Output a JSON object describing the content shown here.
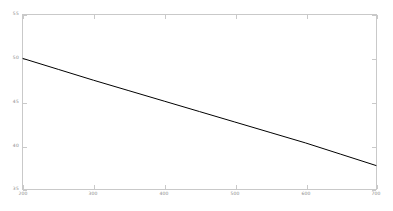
{
  "figure": {
    "background_color": "#ffffff",
    "axis_color": "#c9c9c9",
    "tick_label_color": "#8a8a8a",
    "line_color": "#000000"
  },
  "chart_data": {
    "type": "line",
    "title": "",
    "subtitle": "",
    "xlabel": "",
    "ylabel": "",
    "xlim": [
      200,
      700
    ],
    "ylim": [
      35,
      55
    ],
    "grid": false,
    "legend": null,
    "legend_position": "none",
    "xticks": [
      200,
      300,
      400,
      500,
      600,
      700
    ],
    "xtick_labels": [
      "200",
      "300",
      "400",
      "500",
      "600",
      "700"
    ],
    "yticks": [
      35,
      40,
      45,
      50,
      55
    ],
    "ytick_labels": [
      "35",
      "40",
      "45",
      "50",
      "55"
    ],
    "series": [
      {
        "name": "",
        "color": "#000000",
        "line_width": 1,
        "x": [
          200,
          250,
          300,
          350,
          400,
          450,
          500,
          550,
          600,
          650,
          700
        ],
        "y": [
          50.0,
          48.75,
          47.5,
          46.3,
          45.1,
          43.9,
          42.7,
          41.5,
          40.3,
          39.0,
          37.7
        ]
      }
    ]
  }
}
